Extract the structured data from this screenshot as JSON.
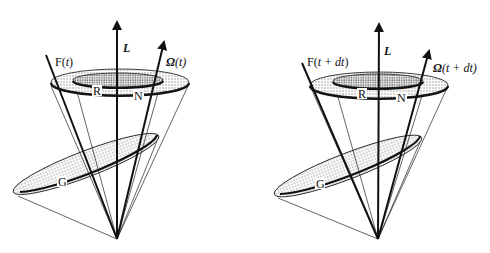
{
  "figure": {
    "panels": [
      {
        "id": "left",
        "labels": {
          "L": "L",
          "F": "F(t)",
          "F_base": "F(",
          "F_var": "t",
          "F_close": ")",
          "Omega": "Ω",
          "Omega_arg": "(t)",
          "R": "R",
          "N": "N",
          "G": "G"
        }
      },
      {
        "id": "right",
        "labels": {
          "L": "L",
          "F": "F(t + dt)",
          "F_base": "F(",
          "F_var": "t + dt",
          "F_close": ")",
          "Omega": "Ω",
          "Omega_arg": "(t + dt)",
          "R": "R",
          "N": "N",
          "G": "G"
        }
      }
    ],
    "colors": {
      "ink": "#111111",
      "shade": "#d8d8d8",
      "shade_dark": "#bdbdbd",
      "background": "#ffffff"
    }
  }
}
